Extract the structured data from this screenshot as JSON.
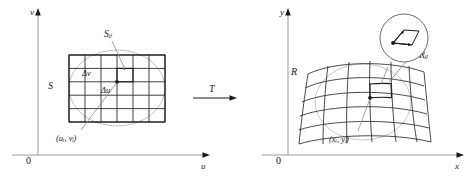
{
  "figure": {
    "transform_label": "T"
  },
  "left_panel": {
    "name": "uv-plane",
    "axis_vertical_label": "v",
    "axis_horizontal_label": "u",
    "origin_label": "0",
    "region_label": "S",
    "subrectangle_label": "Sᵢⱼ",
    "delta_v_label": "Δv",
    "delta_u_label": "Δu",
    "point_label": "(uᵢ, vⱼ)",
    "grid": {
      "cols": 6,
      "rows": 5
    }
  },
  "right_panel": {
    "name": "xy-plane",
    "axis_vertical_label": "y",
    "axis_horizontal_label": "x",
    "origin_label": "0",
    "region_label": "R",
    "subregion_label": "Rᵢⱼ",
    "point_label": "(xᵢ, yⱼ)",
    "grid": {
      "cols": 6,
      "rows": 5
    },
    "inset": {
      "name": "magnified-parallelogram",
      "shape": "parallelogram-with-two-vectors"
    }
  },
  "colors": {
    "ink": "#1a1a1a",
    "grid": "#2b2b2b",
    "axis": "#9a9a9a",
    "ellipse": "#c0c0c0",
    "leader": "#8a8a8a"
  }
}
